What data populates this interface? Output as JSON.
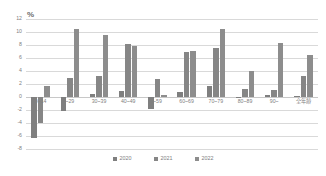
{
  "chart_data": {
    "type": "bar",
    "title": "",
    "subtitle": "",
    "xlabel": "",
    "ylabel": "%",
    "ylim": [
      -8,
      12
    ],
    "ytick_step": 2,
    "yticks": [
      12,
      10,
      8,
      6,
      4,
      2,
      0,
      -2,
      -4,
      -6,
      -8
    ],
    "grid": true,
    "legend_position": "bottom",
    "categories": [
      "0~14",
      "~29",
      "30~39",
      "40~49",
      "~59",
      "60~69",
      "70~79",
      "80~89",
      "90~",
      "全年齢"
    ],
    "series": [
      {
        "name": "2020",
        "color": "#7f7f7f",
        "values": [
          -6.3,
          -2.2,
          0.5,
          1.0,
          -1.9,
          0.7,
          1.7,
          0.0,
          0.3,
          0.2
        ]
      },
      {
        "name": "2021",
        "color": "#868686",
        "values": [
          -4.0,
          3.0,
          3.3,
          8.1,
          2.8,
          6.9,
          7.5,
          1.3,
          1.1,
          3.2
        ]
      },
      {
        "name": "2022",
        "color": "#8d8d8d",
        "values": [
          1.7,
          10.4,
          9.6,
          7.8,
          0.3,
          7.1,
          10.5,
          4.0,
          8.3,
          6.5
        ]
      }
    ]
  },
  "axis": {
    "unit_label": "%"
  }
}
